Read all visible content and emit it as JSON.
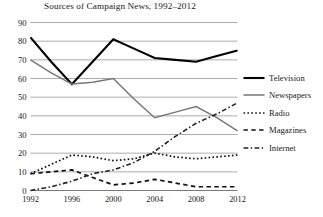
{
  "chart_data": {
    "type": "line",
    "title": "Sources of Campaign News, 1992–2012",
    "xlabel": "",
    "ylabel": "",
    "x": [
      1992,
      1994,
      1996,
      1998,
      2000,
      2002,
      2004,
      2006,
      2008,
      2010,
      2012
    ],
    "xtick_labels": [
      "1992",
      "1996",
      "2000",
      "2004",
      "2008",
      "2012"
    ],
    "xtick_values": [
      1992,
      1996,
      2000,
      2004,
      2008,
      2012
    ],
    "ytick_labels": [
      "0",
      "10",
      "20",
      "30",
      "40",
      "50",
      "60",
      "70",
      "80",
      "90"
    ],
    "ytick_values": [
      0,
      10,
      20,
      30,
      40,
      50,
      60,
      70,
      80,
      90
    ],
    "ylim": [
      0,
      90
    ],
    "xlim": [
      1992,
      2012
    ],
    "grid": "horizontal",
    "legend_position": "right",
    "series": [
      {
        "name": "Television",
        "style": "solid",
        "color": "#000000",
        "width": 2.1,
        "values": [
          82,
          69,
          57,
          69,
          81,
          76,
          71,
          70,
          69,
          72,
          75
        ]
      },
      {
        "name": "Newspapers",
        "style": "solid",
        "color": "#777777",
        "width": 1.5,
        "values": [
          70,
          63,
          57,
          58,
          60,
          49,
          39,
          42,
          45,
          39,
          32
        ]
      },
      {
        "name": "Radio",
        "style": "dotted",
        "color": "#111111",
        "width": 1.7,
        "values": [
          9,
          14,
          19,
          18,
          16,
          17,
          20,
          18,
          17,
          18,
          19
        ]
      },
      {
        "name": "Magazines",
        "style": "dashed",
        "color": "#111111",
        "width": 1.7,
        "values": [
          9,
          10,
          11,
          7,
          3,
          4,
          6,
          4,
          2,
          2,
          2
        ]
      },
      {
        "name": "Internet",
        "style": "dashdot",
        "color": "#222222",
        "width": 1.6,
        "values": [
          0,
          2,
          5,
          9,
          11,
          15,
          21,
          29,
          36,
          41,
          47
        ]
      }
    ]
  },
  "legend": {
    "items": [
      {
        "label": "Television"
      },
      {
        "label": "Newspapers"
      },
      {
        "label": "Radio"
      },
      {
        "label": "Magazines"
      },
      {
        "label": "Internet"
      }
    ]
  }
}
